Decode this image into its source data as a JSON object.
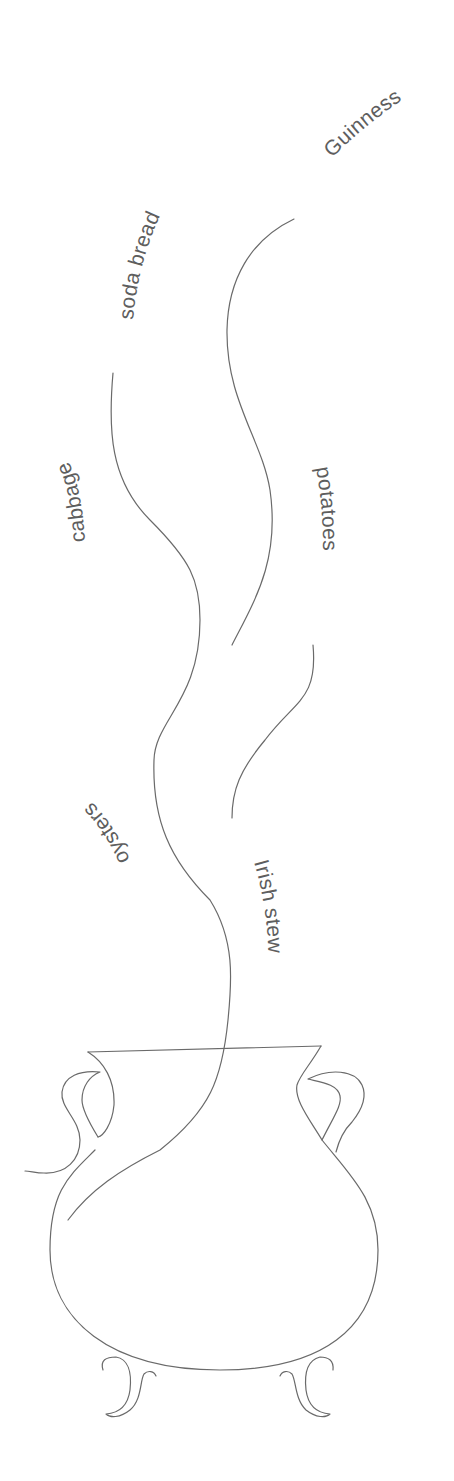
{
  "diagram": {
    "type": "illustration",
    "stroke_color": "#6a6a6a",
    "text_color": "#5e5e5e",
    "background": "#ffffff",
    "labels": {
      "guinness": "Guinness",
      "soda_bread": "soda bread",
      "cabbage": "cabbage",
      "potatoes": "potatoes",
      "oysters": "oysters",
      "irish_stew": "Irish stew"
    }
  }
}
